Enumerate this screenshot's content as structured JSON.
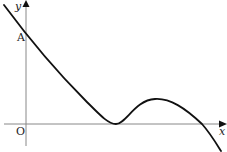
{
  "diagram": {
    "type": "function-graph-sketch",
    "axes": {
      "x_label": "x",
      "y_label": "y",
      "origin_label": "O"
    },
    "points": [
      {
        "label": "A",
        "description": "y-intercept of the curve"
      }
    ],
    "curve": {
      "description": "Curve decreasing from top-left, crossing the y-axis at A, touching the x-axis at a minimum (double root), rising to a local maximum, then falling to cross the x-axis again",
      "features": [
        "y-intercept A",
        "touches x-axis (repeated root)",
        "local maximum",
        "crosses x-axis"
      ]
    },
    "colors": {
      "axis": "#888888",
      "curve": "#111111",
      "text": "#222222",
      "background": "#ffffff"
    }
  }
}
